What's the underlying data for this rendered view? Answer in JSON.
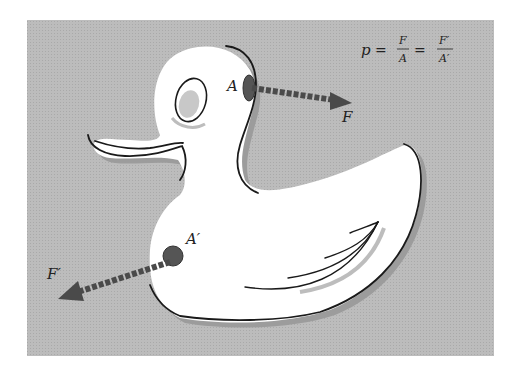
{
  "figure": {
    "colors": {
      "background": "#b9b9b9",
      "duck_body": "#ffffff",
      "duck_shadow": "#9a9a9a",
      "outline": "#1a1a1a",
      "patch": "#555555",
      "arrow": "#4a4a4a"
    }
  },
  "equation": {
    "lhs": "p",
    "eq1": "=",
    "frac1_num": "F",
    "frac1_den": "A",
    "eq2": "=",
    "frac2_num": "F′",
    "frac2_den": "A′"
  },
  "labels": {
    "area_top": "A",
    "force_top": "F",
    "area_bottom": "A′",
    "force_bottom": "F′"
  }
}
